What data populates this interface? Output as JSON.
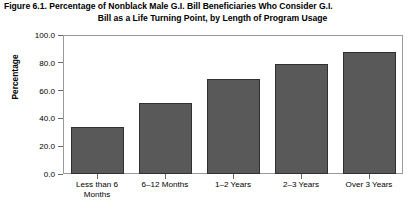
{
  "figure": {
    "title_line1": "Figure 6.1. Percentage of Nonblack Male G.I. Bill Beneficiaries Who Consider G.I.",
    "title_line2": "Bill as a Life Turning Point, by Length of Program Usage"
  },
  "chart_data": {
    "type": "bar",
    "title": "Figure 6.1. Percentage of Nonblack Male G.I. Bill Beneficiaries Who Consider G.I. Bill as a Life Turning Point, by Length of Program Usage",
    "xlabel": "",
    "ylabel": "Percentage",
    "categories": [
      "Less than 6 Months",
      "6–12 Months",
      "1–2 Years",
      "2–3 Years",
      "Over 3 Years"
    ],
    "values": [
      34,
      51,
      68,
      79,
      88
    ],
    "ylim": [
      0,
      100
    ],
    "yticks": [
      0,
      20,
      40,
      60,
      80,
      100
    ],
    "ytick_labels": [
      "0.0",
      "20.0",
      "40.0",
      "60.0",
      "80.0",
      "100.0"
    ],
    "grid": false,
    "legend": null,
    "bar_color": "#59595a",
    "bar_edge_color": "#303030",
    "frame_color": "#9a9a9a",
    "background": "#ffffff"
  }
}
